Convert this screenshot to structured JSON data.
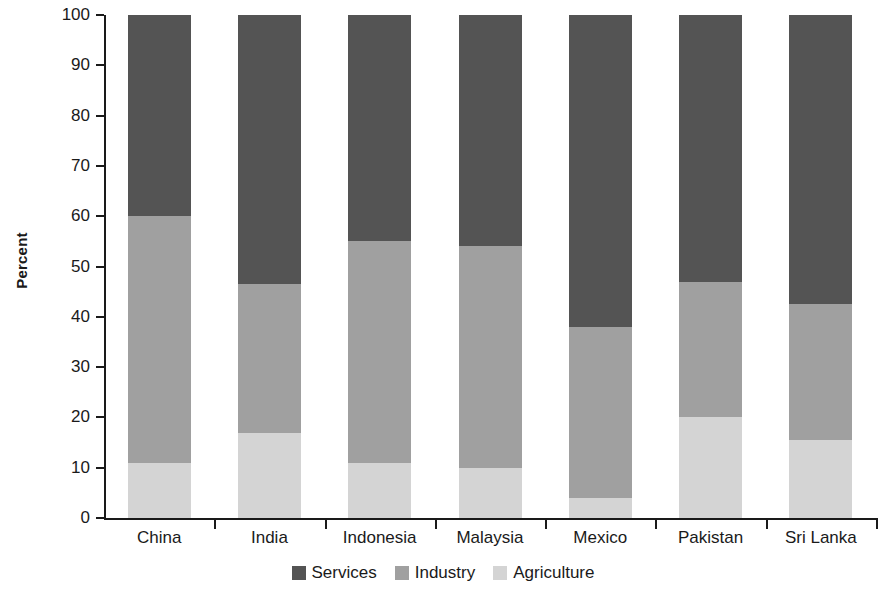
{
  "chart_data": {
    "type": "bar",
    "subtype": "stacked-bar-100-percent",
    "title": "",
    "xlabel": "",
    "ylabel": "Percent",
    "ylim": [
      0,
      100
    ],
    "yticks": [
      0,
      10,
      20,
      30,
      40,
      50,
      60,
      70,
      80,
      90,
      100
    ],
    "ytick_labels": [
      "0",
      "10",
      "20",
      "30",
      "40",
      "50",
      "60",
      "70",
      "80",
      "90",
      "100"
    ],
    "grid": false,
    "legend_position": "bottom-center",
    "categories": [
      "China",
      "India",
      "Indonesia",
      "Malaysia",
      "Mexico",
      "Pakistan",
      "Sri Lanka"
    ],
    "series": [
      {
        "name": "Services",
        "color": "#545454",
        "values": [
          40,
          53.5,
          45,
          46,
          62,
          53,
          57.5
        ]
      },
      {
        "name": "Industry",
        "color": "#a0a0a0",
        "values": [
          49,
          29.5,
          44,
          44,
          34,
          27,
          27
        ]
      },
      {
        "name": "Agriculture",
        "color": "#d4d4d4",
        "values": [
          11,
          17,
          11,
          10,
          4,
          20,
          15.5
        ]
      }
    ],
    "stack_tops": {
      "agriculture": [
        11,
        17,
        11,
        10,
        4,
        20,
        15.5
      ],
      "industry": [
        60,
        46.5,
        55,
        54,
        38,
        47,
        42.5
      ],
      "services": [
        100,
        100,
        100,
        100,
        100,
        100,
        100
      ]
    },
    "legend": [
      {
        "label": "Services",
        "color": "#545454"
      },
      {
        "label": "Industry",
        "color": "#a0a0a0"
      },
      {
        "label": "Agriculture",
        "color": "#d4d4d4"
      }
    ]
  }
}
